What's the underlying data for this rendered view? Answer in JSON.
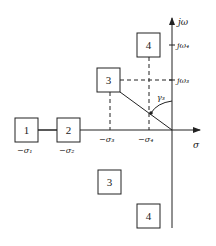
{
  "diagram": {
    "type": "s-plane pole/zero region map",
    "axes": {
      "horizontal_label": "σ",
      "vertical_label": "jω"
    },
    "vertical_ticks": [
      {
        "id": "jw4",
        "label": "jω₄"
      },
      {
        "id": "jw3",
        "label": "jω₃"
      }
    ],
    "horizontal_ticks": [
      {
        "id": "s1",
        "label": "−σ₁"
      },
      {
        "id": "s2",
        "label": "−σ₂"
      },
      {
        "id": "s3",
        "label": "−σ₃"
      },
      {
        "id": "s4",
        "label": "−σ₄"
      }
    ],
    "angle_label": "γ₃",
    "boxes": [
      {
        "id": "box-1",
        "label": "1"
      },
      {
        "id": "box-2",
        "label": "2"
      },
      {
        "id": "box-3-upper",
        "label": "3"
      },
      {
        "id": "box-4-upper",
        "label": "4"
      },
      {
        "id": "box-3-lower",
        "label": "3"
      },
      {
        "id": "box-4-lower",
        "label": "4"
      }
    ]
  }
}
